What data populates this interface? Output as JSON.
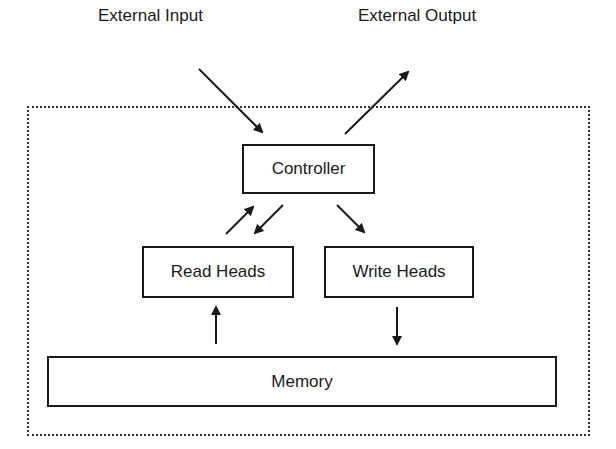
{
  "diagram": {
    "external_labels": {
      "input": "External Input",
      "output": "External Output"
    },
    "nodes": {
      "controller": "Controller",
      "read_heads": "Read Heads",
      "write_heads": "Write Heads",
      "memory": "Memory"
    },
    "edges": [
      {
        "from": "External Input",
        "to": "Controller"
      },
      {
        "from": "Controller",
        "to": "External Output"
      },
      {
        "from": "Read Heads",
        "to": "Controller"
      },
      {
        "from": "Controller",
        "to": "Read Heads"
      },
      {
        "from": "Controller",
        "to": "Write Heads"
      },
      {
        "from": "Memory",
        "to": "Read Heads"
      },
      {
        "from": "Write Heads",
        "to": "Memory"
      }
    ],
    "colors": {
      "line": "#1a1a1a",
      "frame": "#333333",
      "background": "#ffffff"
    }
  }
}
